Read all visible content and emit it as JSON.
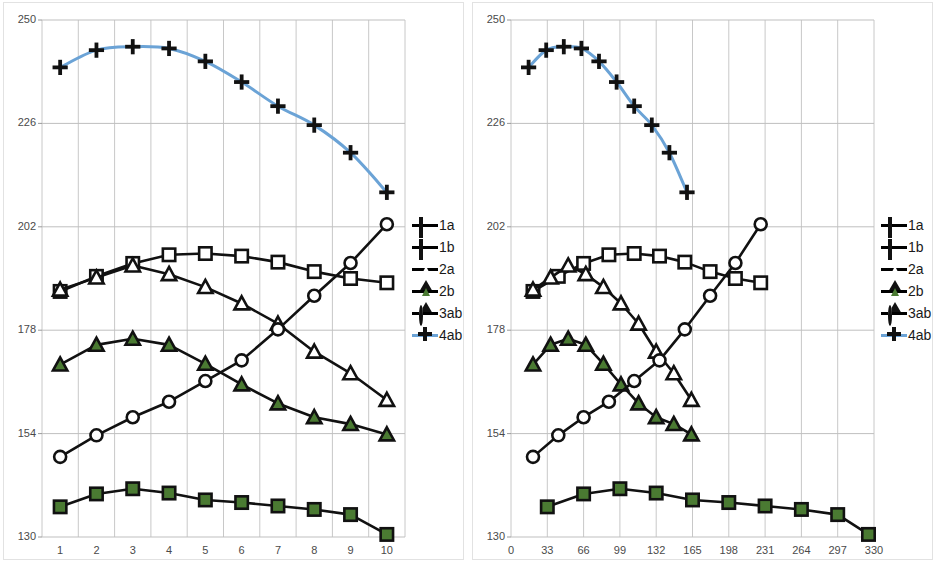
{
  "figure": {
    "panels": [
      "left",
      "right"
    ],
    "legend_position": "right",
    "background": "#ffffff"
  },
  "legend": {
    "items": [
      {
        "label": "1a",
        "marker": "open-square",
        "color": "#ffffff",
        "line": "#111111"
      },
      {
        "label": "1b",
        "marker": "filled-square",
        "color": "#4a7a32",
        "line": "#111111"
      },
      {
        "label": "2a",
        "marker": "open-triangle",
        "color": "#ffffff",
        "line": "#111111"
      },
      {
        "label": "2b",
        "marker": "filled-triangle",
        "color": "#4a7a32",
        "line": "#111111"
      },
      {
        "label": "3ab",
        "marker": "open-circle",
        "color": "#ffffff",
        "line": "#111111"
      },
      {
        "label": "4ab",
        "marker": "plus",
        "color": "#111111",
        "line": "#6ba3d6"
      }
    ]
  },
  "chart_data": [
    {
      "type": "line",
      "panel": "left",
      "title": "",
      "xlabel": "",
      "ylabel": "",
      "x": [
        1,
        2,
        3,
        4,
        5,
        6,
        7,
        8,
        9,
        10
      ],
      "xticks": [
        "1",
        "2",
        "3",
        "4",
        "5",
        "6",
        "7",
        "8",
        "9",
        "10"
      ],
      "yticks": [
        130,
        154,
        178,
        202,
        226,
        250
      ],
      "xlim": [
        0.5,
        10.5
      ],
      "ylim": [
        130,
        250
      ],
      "grid": true,
      "series": [
        {
          "name": "1a",
          "marker": "open-square",
          "color": "#111111",
          "values": [
            187.0,
            190.5,
            193.5,
            195.5,
            195.8,
            195.2,
            193.8,
            191.6,
            190.0,
            189.0
          ]
        },
        {
          "name": "1b",
          "marker": "filled-square",
          "color": "#4a7a32",
          "values": [
            137.0,
            140.0,
            141.2,
            140.2,
            138.6,
            138.0,
            137.2,
            136.4,
            135.2,
            130.6
          ]
        },
        {
          "name": "2a",
          "marker": "open-triangle",
          "color": "#111111",
          "values": [
            187.4,
            190.2,
            193.0,
            191.0,
            188.0,
            184.2,
            179.5,
            173.0,
            168.0,
            161.8
          ]
        },
        {
          "name": "2b",
          "marker": "filled-triangle",
          "color": "#4a7a32",
          "values": [
            170.0,
            174.6,
            176.0,
            174.6,
            170.2,
            165.4,
            161.0,
            157.8,
            156.2,
            153.8
          ]
        },
        {
          "name": "3ab",
          "marker": "open-circle",
          "color": "#111111",
          "values": [
            148.6,
            153.6,
            157.8,
            161.4,
            166.2,
            171.0,
            178.2,
            186.0,
            193.6,
            202.6
          ]
        },
        {
          "name": "4ab",
          "marker": "plus",
          "color": "#6ba3d6",
          "values": [
            239.0,
            243.0,
            243.8,
            243.4,
            240.4,
            235.6,
            230.0,
            225.6,
            219.2,
            210.0
          ]
        }
      ]
    },
    {
      "type": "line",
      "panel": "right",
      "title": "",
      "xlabel": "",
      "ylabel": "",
      "xticks": [
        "0",
        "33",
        "66",
        "99",
        "132",
        "165",
        "198",
        "231",
        "264",
        "297",
        "330"
      ],
      "yticks": [
        130,
        154,
        178,
        202,
        226,
        250
      ],
      "xlim": [
        0,
        330
      ],
      "ylim": [
        130,
        250
      ],
      "grid": true,
      "series": [
        {
          "name": "1a",
          "marker": "open-square",
          "color": "#111111",
          "x": [
            20,
            43,
            66,
            89,
            112,
            135,
            158,
            181,
            204,
            227
          ],
          "values": [
            187.0,
            190.5,
            193.5,
            195.5,
            195.8,
            195.2,
            193.8,
            191.6,
            190.0,
            189.0
          ]
        },
        {
          "name": "1b",
          "marker": "filled-square",
          "color": "#4a7a32",
          "x": [
            33,
            66,
            99,
            132,
            165,
            198,
            231,
            264,
            297,
            325
          ],
          "values": [
            137.0,
            140.0,
            141.2,
            140.2,
            138.6,
            138.0,
            137.2,
            136.4,
            135.2,
            130.6
          ]
        },
        {
          "name": "2a",
          "marker": "open-triangle",
          "color": "#111111",
          "x": [
            20,
            36,
            52,
            68,
            84,
            100,
            116,
            132,
            148,
            164
          ],
          "values": [
            187.4,
            190.2,
            193.0,
            191.0,
            188.0,
            184.2,
            179.5,
            173.0,
            168.0,
            161.8
          ]
        },
        {
          "name": "2b",
          "marker": "filled-triangle",
          "color": "#4a7a32",
          "x": [
            20,
            36,
            52,
            68,
            84,
            100,
            116,
            132,
            148,
            164
          ],
          "values": [
            170.0,
            174.6,
            176.0,
            174.6,
            170.2,
            165.4,
            161.0,
            157.8,
            156.2,
            153.8
          ]
        },
        {
          "name": "3ab",
          "marker": "open-circle",
          "color": "#111111",
          "x": [
            20,
            43,
            66,
            89,
            112,
            135,
            158,
            181,
            204,
            227
          ],
          "values": [
            148.6,
            153.6,
            157.8,
            161.4,
            166.2,
            171.0,
            178.2,
            186.0,
            193.6,
            202.6
          ]
        },
        {
          "name": "4ab",
          "marker": "plus",
          "color": "#6ba3d6",
          "x": [
            16,
            32,
            48,
            64,
            80,
            96,
            112,
            128,
            144,
            160
          ],
          "values": [
            239.0,
            243.0,
            243.8,
            243.4,
            240.4,
            235.6,
            230.0,
            225.6,
            219.2,
            210.0
          ]
        }
      ]
    }
  ]
}
